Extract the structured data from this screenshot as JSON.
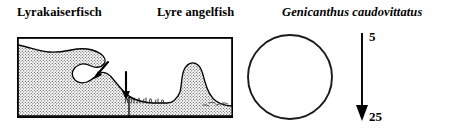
{
  "titles": {
    "german": "Lyrakaiserfisch",
    "english": "Lyre angelfish",
    "scientific": "Genicanthus caudovittatus"
  },
  "habitat_panel": {
    "name": "reef-profile-illustration",
    "description": "Stippled coral reef profile in a rectangular frame with two arrows indicating habitat positions",
    "frame_color": "#000000",
    "fill_pattern": "stipple",
    "arrows": [
      {
        "name": "habitat-arrow-slope",
        "direction": "down-left"
      },
      {
        "name": "habitat-arrow-rubble",
        "direction": "down"
      }
    ]
  },
  "circle_panel": {
    "name": "empty-circle-illustration",
    "outline_color": "#1a1a1a"
  },
  "depth_scale": {
    "shallow": "5",
    "deep": "25",
    "arrow_direction": "down",
    "arrow_color": "#000000"
  }
}
